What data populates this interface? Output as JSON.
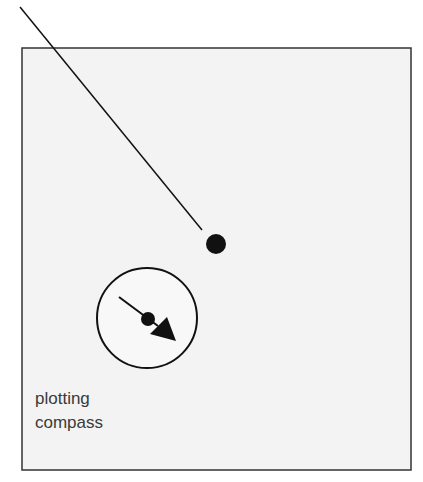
{
  "diagram": {
    "label_line1": "plotting",
    "label_line2": "compass",
    "colors": {
      "background": "#ffffff",
      "panel_fill": "#f3f3f3",
      "panel_border": "#333333",
      "ink": "#111111"
    }
  }
}
